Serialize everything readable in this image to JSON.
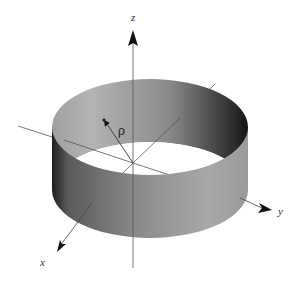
{
  "figure": {
    "type": "cylindrical-surface",
    "axes": {
      "x_label": "x",
      "y_label": "y",
      "z_label": "z"
    },
    "radius_label": "ρ",
    "colors": {
      "axis": "#555555",
      "surface_light": "#c4c4c4",
      "surface_mid": "#8a8a8a",
      "surface_dark": "#2a2a2a",
      "arrow": "#111111"
    }
  }
}
